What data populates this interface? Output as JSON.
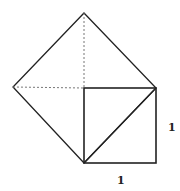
{
  "diagram": {
    "stroke_color": "#222222",
    "dashed_color": "#777777",
    "points": {
      "apex": [
        84,
        13
      ],
      "left": [
        13,
        87
      ],
      "center": [
        84,
        88
      ],
      "right": [
        156,
        88
      ],
      "square_bottom_left": [
        84,
        163
      ],
      "square_bottom_right": [
        156,
        163
      ]
    },
    "labels": {
      "side_right": "1",
      "side_bottom": "1"
    }
  }
}
